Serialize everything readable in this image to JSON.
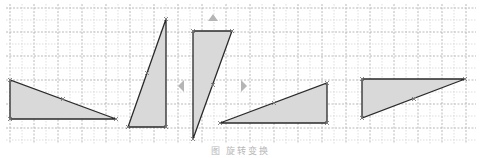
{
  "figure": {
    "caption": "图        旋转变换",
    "background": "#ffffff"
  },
  "grid": {
    "x_start": 10,
    "x_end": 472,
    "y_start": 8,
    "y_end": 140,
    "minor_step": 12,
    "major_every": 2,
    "minor_color": "#d4d4d4",
    "major_color": "#a8a8a8"
  },
  "style": {
    "fill": "#d9d9d9",
    "stroke": "#2a2a2a",
    "vertex_marker_color": "#7a7a7a",
    "arrow_color": "#b5b5b5"
  },
  "shapes": [
    {
      "id": "triangle-1",
      "points": [
        [
          10,
          80
        ],
        [
          10,
          119
        ],
        [
          116,
          119
        ]
      ],
      "midpoint": [
        63,
        99
      ]
    },
    {
      "id": "triangle-2",
      "points": [
        [
          166,
          19
        ],
        [
          166,
          127
        ],
        [
          128,
          127
        ]
      ],
      "midpoint": [
        147,
        73
      ]
    },
    {
      "id": "triangle-3",
      "points": [
        [
          193,
          31
        ],
        [
          232,
          31
        ],
        [
          193,
          139
        ]
      ],
      "midpoint": [
        213,
        85
      ]
    },
    {
      "id": "triangle-4",
      "points": [
        [
          220,
          123
        ],
        [
          327,
          83
        ],
        [
          327,
          123
        ]
      ],
      "midpoint": [
        274,
        103
      ]
    },
    {
      "id": "triangle-5",
      "points": [
        [
          362,
          79
        ],
        [
          465,
          79
        ],
        [
          362,
          118
        ]
      ],
      "midpoint": [
        414,
        99
      ]
    }
  ],
  "arrows": [
    {
      "id": "arrow-up",
      "direction": "up",
      "at": [
        213,
        18
      ]
    },
    {
      "id": "arrow-left",
      "direction": "left",
      "at": [
        181,
        86
      ]
    },
    {
      "id": "arrow-right",
      "direction": "right",
      "at": [
        244,
        86
      ]
    }
  ]
}
